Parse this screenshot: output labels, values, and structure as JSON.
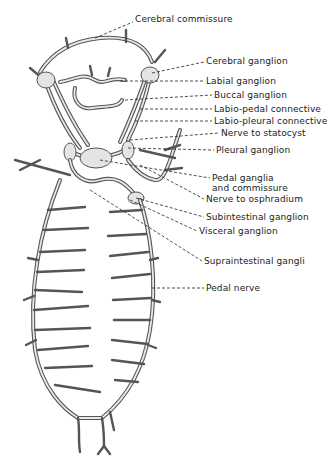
{
  "figure": {
    "labels": [
      {
        "id": "cerebral-commissure",
        "text": "Cerebral commissure",
        "x": 135,
        "y": 19
      },
      {
        "id": "cerebral-ganglion",
        "text": "Cerebral ganglion",
        "x": 206,
        "y": 59
      },
      {
        "id": "labial-ganglion",
        "text": "Labial ganglion",
        "x": 206,
        "y": 78
      },
      {
        "id": "buccal-ganglion",
        "text": "Buccal ganglion",
        "x": 214,
        "y": 92
      },
      {
        "id": "labio-pedal-connective",
        "text": "Labio-pedal connective",
        "x": 214,
        "y": 106
      },
      {
        "id": "labio-pleural-connective",
        "text": "Labio-pleural connective",
        "x": 214,
        "y": 118
      },
      {
        "id": "nerve-to-statocyst",
        "text": "Nerve to statocyst",
        "x": 221,
        "y": 130
      },
      {
        "id": "pleural-ganglion",
        "text": "Pleural ganglion",
        "x": 216,
        "y": 147
      },
      {
        "id": "pedal-ganglia-line1",
        "text": "Pedal ganglia",
        "x": 212,
        "y": 175
      },
      {
        "id": "pedal-ganglia-line2",
        "text": "and commissure",
        "x": 212,
        "y": 185
      },
      {
        "id": "nerve-to-osphradium",
        "text": "Nerve to osphradium",
        "x": 206,
        "y": 196
      },
      {
        "id": "subintestinal-ganglion",
        "text": "Subintestinal ganglion",
        "x": 206,
        "y": 214
      },
      {
        "id": "visceral-ganglion",
        "text": "Visceral ganglion",
        "x": 199,
        "y": 228
      },
      {
        "id": "supraintestinal-ganglion",
        "text": "Supraintestinal gangli",
        "x": 204,
        "y": 258
      },
      {
        "id": "pedal-nerve",
        "text": "Pedal nerve",
        "x": 206,
        "y": 285
      }
    ]
  }
}
